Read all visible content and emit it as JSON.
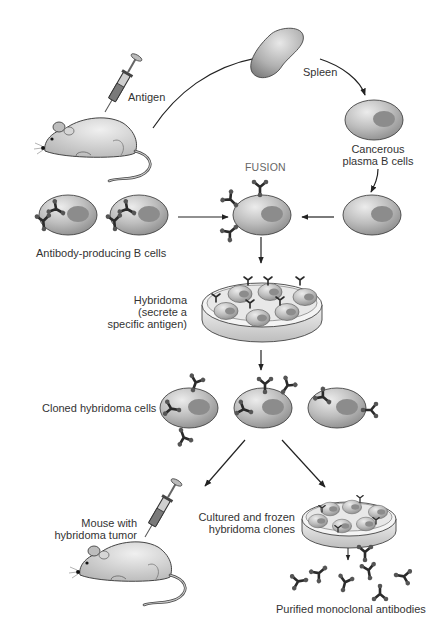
{
  "diagram": {
    "labels": {
      "antigen": "Antigen",
      "spleen": "Spleen",
      "cancerous_line1": "Cancerous",
      "cancerous_line2": "plasma B cells",
      "fusion": "FUSION",
      "antibody_b_cells": "Antibody-producing B cells",
      "hybridoma_line1": "Hybridoma",
      "hybridoma_line2": "(secrete a",
      "hybridoma_line3": "specific antigen)",
      "cloned": "Cloned hybridoma cells",
      "mouse_line1": "Mouse with",
      "mouse_line2": "hybridoma tumor",
      "cultured_line1": "Cultured and frozen",
      "cultured_line2": "hybridoma clones",
      "purified": "Purified monoclonal antibodies"
    },
    "colors": {
      "cell_fill": "#b8b8b8",
      "cell_highlight": "#e6e6e6",
      "nucleus": "#8a8a8a",
      "antibody": "#2a2a2a",
      "arrow": "#222222",
      "mouse": "#c8c8c8",
      "text": "#333333"
    }
  }
}
